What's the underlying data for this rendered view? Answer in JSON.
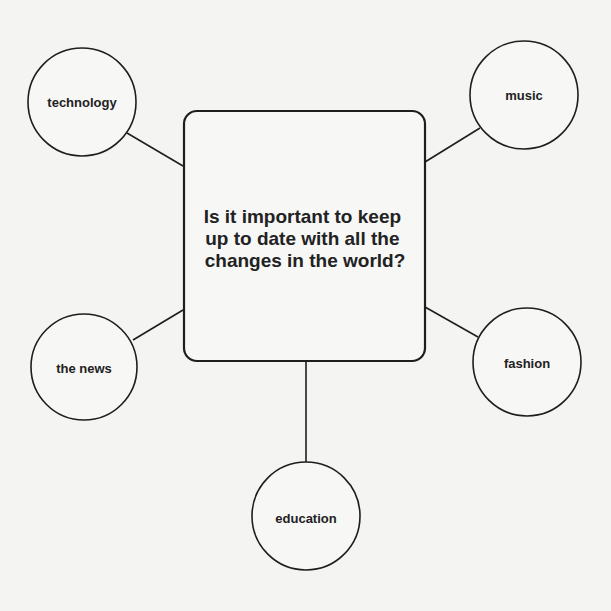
{
  "diagram": {
    "type": "mind-map",
    "center": {
      "lines": [
        "Is it important to keep",
        "up to date with all the",
        "changes in the world?"
      ]
    },
    "nodes": [
      {
        "id": "technology",
        "label": "technology"
      },
      {
        "id": "music",
        "label": "music"
      },
      {
        "id": "the-news",
        "label": "the news"
      },
      {
        "id": "fashion",
        "label": "fashion"
      },
      {
        "id": "education",
        "label": "education"
      }
    ],
    "colors": {
      "stroke": "#1e1e1e",
      "background": "#f4f4f3",
      "fill": "#f7f7f6"
    }
  }
}
